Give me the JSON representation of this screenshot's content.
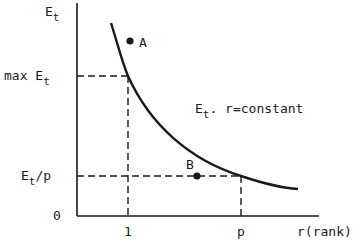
{
  "diagram": {
    "title": "",
    "y_axis": {
      "label_main": "E",
      "label_sub": "t"
    },
    "x_axis": {
      "label": "r(rank)"
    },
    "y_ticks": {
      "max": {
        "prefix": "max E",
        "sub": "t"
      },
      "ratio": {
        "main": "E",
        "sub": "t",
        "suffix": "/p"
      },
      "zero": "0"
    },
    "x_ticks": {
      "one": "1",
      "p": "p"
    },
    "curve_label": {
      "main": "E",
      "sub": "t",
      "suffix": ". r=constant"
    },
    "points": [
      {
        "name": "A",
        "label": "A"
      },
      {
        "name": "B",
        "label": "B"
      }
    ],
    "colors": {
      "ink": "#1a1a1a",
      "background": "#ffffff"
    }
  }
}
